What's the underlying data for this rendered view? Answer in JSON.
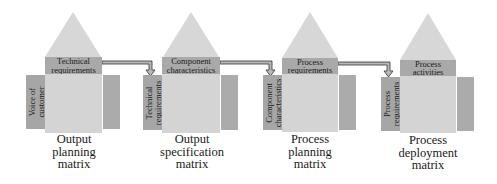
{
  "diagram": {
    "type": "QFD house-of-quality cascade",
    "colors": {
      "roof": "#d7d7d7",
      "header": "#a9a9a9",
      "body": "#d4d4d4",
      "side_columns": "#a6a6a6",
      "arrow_fill": "#b8b8b8",
      "arrow_outline": "#333333",
      "text": "#1a1a1a"
    },
    "houses": [
      {
        "header_lines": [
          "Technical",
          "requirements"
        ],
        "left_lines": [
          "Voice of",
          "customer"
        ],
        "caption_lines": [
          "Output",
          "planning",
          "matrix"
        ]
      },
      {
        "header_lines": [
          "Component",
          "characteristics"
        ],
        "left_lines": [
          "Technical",
          "requirements"
        ],
        "caption_lines": [
          "Output",
          "specification",
          "matrix"
        ]
      },
      {
        "header_lines": [
          "Process",
          "requirements"
        ],
        "left_lines": [
          "Component",
          "characteristics"
        ],
        "caption_lines": [
          "Process",
          "planning",
          "matrix"
        ]
      },
      {
        "header_lines": [
          "Process",
          "activities"
        ],
        "left_lines": [
          "Process",
          "requirements"
        ],
        "caption_lines": [
          "Process",
          "deployment",
          "matrix"
        ]
      }
    ],
    "connectors": [
      {
        "from": "Technical requirements",
        "to": "Technical requirements"
      },
      {
        "from": "Component characteristics",
        "to": "Component characteristics"
      },
      {
        "from": "Process requirements",
        "to": "Process requirements"
      }
    ]
  }
}
